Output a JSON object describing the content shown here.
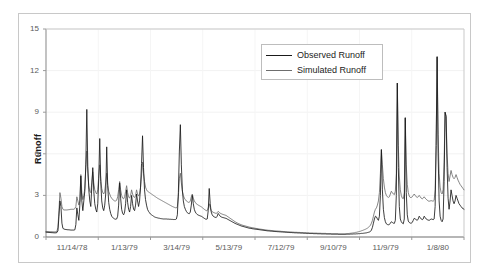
{
  "chart_data": {
    "type": "line",
    "title": "",
    "xlabel": "",
    "ylabel": "Runoff",
    "ylim": [
      0,
      15
    ],
    "yticks": [
      0,
      3,
      6,
      9,
      12,
      15
    ],
    "grid": true,
    "legend_position": "top-right",
    "x_tick_labels": [
      "11/14/78",
      "1/13/79",
      "3/14/79",
      "5/13/79",
      "7/12/79",
      "9/10/79",
      "11/9/79",
      "1/8/80"
    ],
    "x_index_range": [
      0,
      420
    ],
    "series": [
      {
        "name": "Observed Runoff",
        "color": "#1a1a1a",
        "values": [
          0.35,
          0.34,
          0.33,
          0.33,
          0.32,
          0.32,
          0.31,
          0.31,
          0.3,
          0.3,
          0.3,
          0.32,
          0.45,
          1.5,
          2.6,
          2.2,
          1.0,
          0.62,
          0.58,
          0.55,
          0.54,
          0.53,
          0.52,
          0.52,
          0.51,
          0.5,
          0.5,
          0.5,
          0.5,
          0.52,
          0.9,
          2.1,
          1.6,
          1.2,
          2.3,
          4.4,
          2.6,
          1.9,
          2.6,
          3.3,
          5.2,
          9.2,
          5.1,
          3.4,
          2.6,
          2.2,
          3.6,
          5.0,
          3.3,
          2.4,
          2.0,
          1.8,
          2.4,
          4.2,
          7.1,
          4.0,
          2.6,
          2.1,
          1.9,
          2.3,
          3.1,
          6.5,
          3.7,
          2.5,
          2.0,
          1.7,
          1.5,
          1.4,
          1.35,
          1.3,
          1.28,
          1.3,
          1.5,
          2.3,
          3.9,
          2.8,
          2.0,
          1.7,
          1.6,
          1.8,
          2.4,
          3.4,
          2.5,
          2.0,
          1.8,
          2.2,
          3.0,
          2.4,
          2.0,
          1.9,
          2.3,
          3.1,
          2.6,
          2.2,
          2.6,
          3.6,
          5.3,
          7.3,
          5.0,
          3.4,
          2.7,
          2.3,
          2.0,
          1.85,
          1.75,
          1.65,
          1.6,
          1.55,
          1.5,
          1.45,
          1.42,
          1.4,
          1.38,
          1.36,
          1.35,
          1.33,
          1.32,
          1.31,
          1.3,
          1.3,
          1.3,
          1.3,
          1.29,
          1.29,
          1.28,
          1.28,
          1.27,
          1.27,
          1.26,
          1.26,
          1.26,
          1.3,
          1.6,
          3.2,
          6.2,
          8.1,
          5.2,
          3.4,
          2.6,
          2.2,
          2.0,
          1.85,
          1.75,
          1.7,
          1.68,
          1.8,
          2.3,
          3.0,
          2.4,
          2.0,
          1.8,
          1.7,
          1.62,
          1.58,
          1.55,
          1.52,
          1.5,
          1.45,
          1.4,
          1.35,
          1.3,
          1.28,
          1.3,
          1.9,
          3.5,
          2.4,
          1.8,
          1.6,
          1.5,
          1.45,
          1.42,
          1.4,
          1.5,
          1.7,
          1.6,
          1.5,
          1.45,
          1.42,
          1.4,
          1.38,
          1.36,
          1.34,
          1.3,
          1.26,
          1.22,
          1.18,
          1.14,
          1.1,
          1.06,
          1.02,
          0.98,
          0.95,
          0.92,
          0.89,
          0.86,
          0.83,
          0.8,
          0.78,
          0.76,
          0.74,
          0.72,
          0.7,
          0.68,
          0.66,
          0.64,
          0.63,
          0.62,
          0.6,
          0.59,
          0.58,
          0.57,
          0.56,
          0.55,
          0.54,
          0.53,
          0.52,
          0.51,
          0.5,
          0.49,
          0.48,
          0.47,
          0.46,
          0.45,
          0.44,
          0.44,
          0.43,
          0.42,
          0.42,
          0.41,
          0.4,
          0.4,
          0.39,
          0.39,
          0.38,
          0.38,
          0.37,
          0.37,
          0.36,
          0.36,
          0.35,
          0.35,
          0.34,
          0.34,
          0.33,
          0.33,
          0.32,
          0.32,
          0.32,
          0.31,
          0.31,
          0.3,
          0.3,
          0.3,
          0.29,
          0.29,
          0.29,
          0.28,
          0.28,
          0.28,
          0.27,
          0.27,
          0.27,
          0.26,
          0.26,
          0.26,
          0.25,
          0.25,
          0.25,
          0.25,
          0.24,
          0.24,
          0.24,
          0.24,
          0.23,
          0.23,
          0.23,
          0.23,
          0.22,
          0.22,
          0.22,
          0.22,
          0.22,
          0.21,
          0.21,
          0.21,
          0.21,
          0.21,
          0.2,
          0.2,
          0.2,
          0.2,
          0.2,
          0.2,
          0.2,
          0.19,
          0.19,
          0.19,
          0.19,
          0.19,
          0.19,
          0.19,
          0.19,
          0.2,
          0.2,
          0.2,
          0.2,
          0.21,
          0.21,
          0.21,
          0.22,
          0.22,
          0.22,
          0.23,
          0.23,
          0.24,
          0.24,
          0.25,
          0.26,
          0.26,
          0.27,
          0.28,
          0.29,
          0.3,
          0.32,
          0.34,
          0.36,
          0.4,
          0.5,
          0.7,
          1.0,
          1.3,
          1.5,
          1.45,
          1.3,
          1.2,
          1.5,
          3.0,
          6.3,
          3.4,
          2.0,
          1.4,
          1.1,
          0.95,
          0.9,
          0.88,
          0.9,
          1.0,
          1.1,
          1.05,
          1.0,
          0.98,
          1.2,
          3.0,
          11.1,
          5.0,
          2.2,
          1.3,
          1.1,
          1.0,
          0.95,
          1.3,
          8.6,
          3.2,
          1.6,
          1.15,
          1.05,
          1.0,
          1.0,
          1.05,
          1.2,
          1.35,
          1.3,
          1.25,
          1.2,
          1.3,
          1.5,
          1.4,
          1.3,
          1.25,
          1.3,
          1.5,
          1.4,
          1.3,
          1.25,
          1.22,
          1.2,
          1.25,
          1.3,
          1.28,
          1.25,
          1.3,
          2.2,
          6.6,
          13.0,
          6.0,
          2.6,
          1.5,
          1.2,
          1.1,
          1.3,
          4.0,
          9.0,
          8.7,
          5.0,
          2.8,
          2.0,
          2.6,
          3.4,
          3.0,
          2.6,
          2.4,
          2.6,
          3.0,
          2.8,
          2.6,
          2.4,
          2.3,
          2.2,
          2.1,
          2.05,
          2.0
        ]
      },
      {
        "name": "Simulated Runoff",
        "color": "#6e6e6e",
        "values": [
          0.4,
          0.4,
          0.39,
          0.39,
          0.38,
          0.38,
          0.38,
          0.37,
          0.37,
          0.37,
          0.38,
          0.42,
          0.7,
          1.9,
          3.2,
          2.8,
          2.2,
          2.0,
          1.95,
          1.95,
          1.95,
          1.95,
          1.96,
          1.97,
          1.98,
          2.0,
          2.0,
          2.0,
          2.0,
          2.05,
          2.2,
          2.9,
          2.6,
          2.3,
          2.6,
          4.5,
          3.2,
          2.7,
          3.0,
          3.5,
          5.0,
          6.2,
          4.6,
          3.7,
          3.3,
          3.2,
          3.9,
          4.7,
          3.9,
          3.4,
          3.2,
          3.1,
          3.4,
          4.4,
          5.2,
          4.2,
          3.5,
          3.2,
          3.1,
          3.3,
          3.9,
          4.6,
          3.8,
          3.3,
          3.1,
          2.9,
          2.8,
          2.7,
          2.65,
          2.6,
          2.6,
          2.65,
          2.9,
          3.4,
          4.0,
          3.4,
          3.0,
          2.8,
          2.75,
          2.9,
          3.3,
          3.7,
          3.2,
          2.9,
          2.8,
          3.0,
          3.4,
          3.1,
          2.9,
          2.85,
          3.0,
          3.4,
          3.1,
          2.95,
          3.1,
          3.6,
          4.4,
          5.4,
          4.6,
          4.0,
          3.6,
          3.4,
          3.3,
          3.25,
          3.2,
          3.15,
          3.1,
          3.05,
          3.0,
          2.95,
          2.9,
          2.85,
          2.8,
          2.76,
          2.72,
          2.68,
          2.64,
          2.6,
          2.56,
          2.52,
          2.48,
          2.44,
          2.4,
          2.36,
          2.32,
          2.28,
          2.24,
          2.2,
          2.17,
          2.14,
          2.11,
          2.1,
          2.2,
          2.9,
          4.2,
          4.6,
          3.9,
          3.3,
          3.0,
          2.8,
          2.7,
          2.6,
          2.55,
          2.5,
          2.5,
          2.6,
          2.9,
          3.1,
          2.8,
          2.6,
          2.5,
          2.4,
          2.35,
          2.3,
          2.26,
          2.22,
          2.18,
          2.12,
          2.06,
          2.0,
          1.95,
          1.9,
          1.9,
          2.1,
          2.4,
          2.1,
          1.9,
          1.82,
          1.78,
          1.75,
          1.72,
          1.7,
          1.75,
          1.85,
          1.78,
          1.72,
          1.68,
          1.65,
          1.62,
          1.6,
          1.58,
          1.55,
          1.5,
          1.45,
          1.4,
          1.35,
          1.3,
          1.25,
          1.2,
          1.15,
          1.1,
          1.06,
          1.02,
          0.98,
          0.95,
          0.92,
          0.89,
          0.86,
          0.84,
          0.82,
          0.8,
          0.78,
          0.76,
          0.74,
          0.72,
          0.7,
          0.69,
          0.67,
          0.66,
          0.65,
          0.63,
          0.62,
          0.61,
          0.6,
          0.58,
          0.57,
          0.56,
          0.55,
          0.54,
          0.53,
          0.52,
          0.51,
          0.5,
          0.49,
          0.48,
          0.48,
          0.47,
          0.46,
          0.46,
          0.45,
          0.44,
          0.44,
          0.43,
          0.43,
          0.42,
          0.42,
          0.41,
          0.4,
          0.4,
          0.39,
          0.39,
          0.38,
          0.38,
          0.37,
          0.37,
          0.37,
          0.36,
          0.36,
          0.35,
          0.35,
          0.34,
          0.34,
          0.34,
          0.33,
          0.33,
          0.33,
          0.32,
          0.32,
          0.32,
          0.31,
          0.31,
          0.31,
          0.3,
          0.3,
          0.3,
          0.29,
          0.29,
          0.29,
          0.29,
          0.28,
          0.28,
          0.28,
          0.28,
          0.27,
          0.27,
          0.27,
          0.27,
          0.26,
          0.26,
          0.26,
          0.26,
          0.26,
          0.25,
          0.25,
          0.25,
          0.25,
          0.25,
          0.24,
          0.24,
          0.24,
          0.24,
          0.24,
          0.24,
          0.24,
          0.23,
          0.23,
          0.23,
          0.23,
          0.23,
          0.23,
          0.23,
          0.24,
          0.24,
          0.25,
          0.25,
          0.26,
          0.27,
          0.28,
          0.29,
          0.3,
          0.31,
          0.33,
          0.34,
          0.36,
          0.38,
          0.4,
          0.42,
          0.45,
          0.47,
          0.5,
          0.53,
          0.56,
          0.6,
          0.64,
          0.7,
          0.76,
          0.85,
          1.0,
          1.2,
          1.5,
          1.8,
          2.0,
          2.1,
          2.3,
          2.6,
          3.2,
          4.6,
          6.3,
          5.2,
          4.2,
          3.6,
          3.2,
          3.0,
          2.9,
          2.85,
          2.9,
          3.1,
          3.3,
          3.2,
          3.1,
          3.05,
          3.3,
          4.6,
          11.1,
          6.6,
          4.4,
          3.4,
          3.0,
          2.8,
          2.75,
          3.2,
          8.6,
          5.2,
          3.8,
          3.2,
          2.95,
          2.85,
          2.85,
          2.9,
          3.0,
          3.1,
          3.0,
          2.9,
          2.85,
          2.9,
          3.0,
          2.9,
          2.8,
          2.75,
          2.8,
          2.9,
          2.8,
          2.72,
          2.66,
          2.6,
          2.58,
          2.6,
          2.62,
          2.6,
          2.58,
          2.65,
          3.4,
          6.6,
          13.0,
          7.4,
          4.6,
          3.6,
          3.2,
          3.1,
          3.4,
          5.4,
          9.0,
          8.7,
          6.0,
          4.6,
          4.0,
          4.4,
          4.8,
          4.5,
          4.3,
          4.2,
          4.3,
          4.5,
          4.3,
          4.1,
          3.95,
          3.8,
          3.7,
          3.6,
          3.5,
          3.4
        ]
      }
    ]
  },
  "axes": {
    "y_tick_labels": [
      "15",
      "12",
      "9",
      "6",
      "3",
      "0"
    ],
    "y_axis_title": "Runoff"
  },
  "legend": {
    "items": [
      {
        "label": "Observed Runoff",
        "color": "#1a1a1a"
      },
      {
        "label": "Simulated Runoff",
        "color": "#6e6e6e"
      }
    ]
  }
}
